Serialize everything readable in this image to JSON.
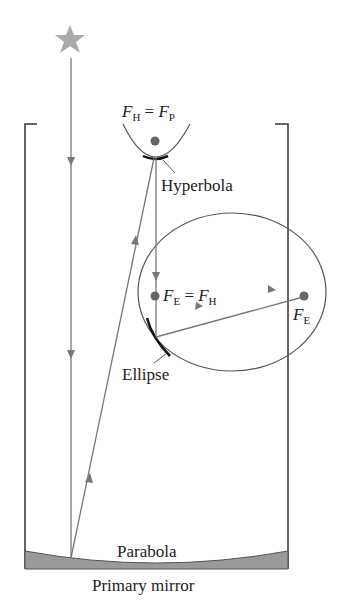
{
  "diagram": {
    "labels": {
      "hyperbola_focus_F": "F",
      "hyperbola_focus_sub_left": "H",
      "eq": " = ",
      "hyperbola_focus_sub_right": "P",
      "hyperbola": "Hyperbola",
      "ellipse_focus_sub_left": "E",
      "ellipse_focus_sub_right": "H",
      "far_focus_sub": "E",
      "ellipse": "Ellipse",
      "parabola": "Parabola",
      "primary_mirror": "Primary mirror"
    },
    "colors": {
      "ray": "#777777",
      "outline": "#333333",
      "star": "#aaaaaa",
      "mirror_fill": "#9a9a9a",
      "focus_dot": "#666666"
    }
  }
}
